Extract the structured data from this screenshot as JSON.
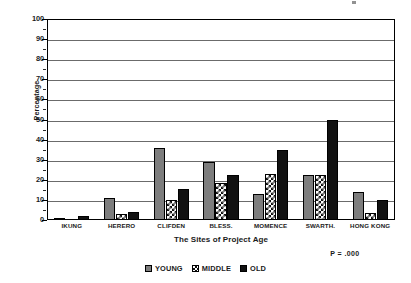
{
  "chart_data": {
    "type": "bar",
    "title": "",
    "xlabel": "The Sites of Project Age",
    "ylabel": "Percentage",
    "ylim": [
      0,
      100
    ],
    "ytick_step": 10,
    "yticks": [
      0,
      10,
      20,
      30,
      40,
      50,
      60,
      70,
      80,
      90,
      100
    ],
    "grid": true,
    "grid_axis": "y",
    "legend_position": "bottom-center",
    "categories": [
      "IKUNG",
      "HERERO",
      "CLIFDEN",
      "BLESS.",
      "MOMENCE",
      "SWARTH.",
      "HONG KONG"
    ],
    "series": [
      {
        "name": "YOUNG",
        "color": "#7d7d7d",
        "fill": "solid-gray",
        "values": [
          1,
          11,
          36,
          29,
          13,
          22.5,
          14
        ]
      },
      {
        "name": "MIDDLE",
        "color": "#ffffff",
        "fill": "checkerboard",
        "values": [
          0,
          3,
          10,
          18.5,
          23,
          22.5,
          3.5
        ]
      },
      {
        "name": "OLD",
        "color": "#111111",
        "fill": "solid-black",
        "values": [
          2,
          4,
          15.5,
          22.5,
          35,
          50,
          10
        ]
      }
    ],
    "annotations": [
      {
        "text": "P = .000",
        "position": "below-right-of-axis"
      }
    ]
  },
  "legend": {
    "items": [
      {
        "label": "YOUNG",
        "swatch": "solid-gray-swatch"
      },
      {
        "label": "MIDDLE",
        "swatch": "checkerboard-swatch"
      },
      {
        "label": "OLD",
        "swatch": "solid-black-swatch"
      }
    ]
  }
}
